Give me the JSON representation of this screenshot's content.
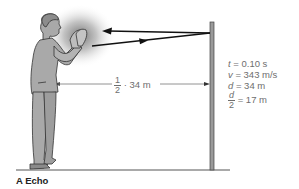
{
  "diagram": {
    "caption": "A Echo",
    "distance_label": {
      "fraction_num": "1",
      "fraction_den": "2",
      "text": "· 34 m"
    },
    "equations": [
      {
        "var": "t",
        "rest": " = 0.10 s"
      },
      {
        "var": "v",
        "rest": " = 343 m/s"
      },
      {
        "var": "d",
        "rest": " = 34 m"
      }
    ],
    "half_distance": {
      "num": "d",
      "den": "2",
      "rest": " = 17 m"
    },
    "elements": {
      "person": "man-clapping-hands",
      "wall": "reflecting-wall",
      "sound_wave": "sound-burst",
      "incident_arrow": "arrow-to-wall",
      "reflected_arrow": "arrow-from-wall",
      "ground": "ground-line"
    },
    "colors": {
      "line": "#111111",
      "figure_fill": "#a9a9a9",
      "figure_stroke": "#333333",
      "wall_fill": "#9a9a9a",
      "text": "#6e6e6e"
    }
  }
}
